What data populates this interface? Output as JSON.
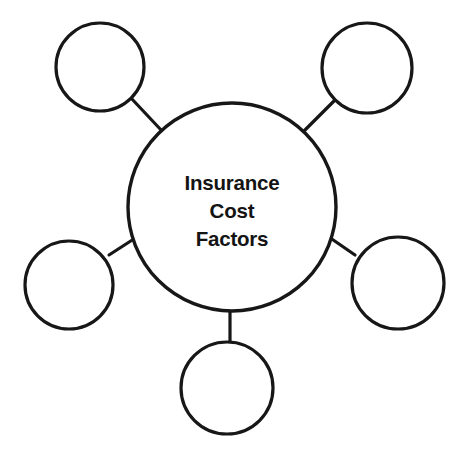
{
  "diagram": {
    "type": "hub-and-spoke cluster diagram",
    "background_color": "#ffffff",
    "stroke_color": "#171717",
    "text_color": "#141414",
    "central_node": {
      "name": "insurance-cost-factors",
      "label_lines": [
        "Insurance",
        "Cost",
        "Factors"
      ],
      "line1": "Insurance",
      "line2": "Cost",
      "line3": "Factors",
      "cx": 232,
      "cy": 207,
      "r": 104
    },
    "satellite_nodes": [
      {
        "name": "satellite-top-left",
        "label": "",
        "cx": 100,
        "cy": 67,
        "r": 44
      },
      {
        "name": "satellite-top-right",
        "label": "",
        "cx": 367,
        "cy": 68,
        "r": 45
      },
      {
        "name": "satellite-left",
        "label": "",
        "cx": 69,
        "cy": 285,
        "r": 44
      },
      {
        "name": "satellite-right",
        "label": "",
        "cx": 398,
        "cy": 283,
        "r": 46
      },
      {
        "name": "satellite-bottom",
        "label": "",
        "cx": 227,
        "cy": 388,
        "r": 46
      }
    ],
    "connectors": [
      {
        "name": "connector-top-left",
        "x1": 131,
        "y1": 98,
        "x2": 162,
        "y2": 131
      },
      {
        "name": "connector-top-right",
        "x1": 335,
        "y1": 100,
        "x2": 303,
        "y2": 132
      },
      {
        "name": "connector-left",
        "x1": 109,
        "y1": 255,
        "x2": 140,
        "y2": 235
      },
      {
        "name": "connector-right",
        "x1": 355,
        "y1": 255,
        "x2": 326,
        "y2": 235
      },
      {
        "name": "connector-bottom",
        "x1": 230,
        "y1": 311,
        "x2": 230,
        "y2": 342
      }
    ]
  }
}
